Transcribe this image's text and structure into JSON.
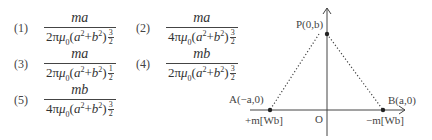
{
  "options": [
    {
      "label": "(1)",
      "numerator": "ma",
      "coef": "2",
      "exp_num": "3",
      "exp_den": "2"
    },
    {
      "label": "(2)",
      "numerator": "ma",
      "coef": "4",
      "exp_num": "3",
      "exp_den": "2"
    },
    {
      "label": "(3)",
      "numerator": "ma",
      "coef": "2",
      "exp_num": "1",
      "exp_den": "2"
    },
    {
      "label": "(4)",
      "numerator": "mb",
      "coef": "2",
      "exp_num": "3",
      "exp_den": "2"
    },
    {
      "label": "(5)",
      "numerator": "mb",
      "coef": "4",
      "exp_num": "3",
      "exp_den": "2"
    }
  ],
  "diagram": {
    "point_P": "P(0,b)",
    "point_A": "A(−a,0)",
    "point_B": "B(a,0)",
    "origin": "O",
    "charge_A": "+m[Wb]",
    "charge_B": "−m[Wb]"
  }
}
